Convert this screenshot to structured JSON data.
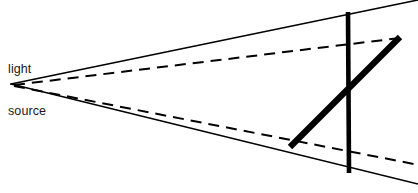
{
  "figure": {
    "background_color": "#ffffff",
    "ink_color": "#000000",
    "width": 418,
    "height": 193
  },
  "labels": {
    "light_source": {
      "line1": "light",
      "line2": "source",
      "x": 8,
      "y": 34,
      "color": "#1a1a1a"
    }
  },
  "geometry": {
    "light_source_point": {
      "x": 11,
      "y": 84
    },
    "solid_rays": [
      {
        "name": "upper-solid-ray",
        "x1": 11,
        "y1": 84,
        "x2": 418,
        "y2": 0,
        "stroke_width": 1.6,
        "style": "solid"
      },
      {
        "name": "lower-solid-ray",
        "x1": 11,
        "y1": 84,
        "x2": 418,
        "y2": 184,
        "stroke_width": 1.6,
        "style": "solid"
      }
    ],
    "dashed_rays": [
      {
        "name": "upper-dashed-ray",
        "x1": 14,
        "y1": 85,
        "x2": 400,
        "y2": 38,
        "stroke_width": 2.0,
        "style": "dashed",
        "dash_pattern": "11 7"
      },
      {
        "name": "lower-dashed-ray",
        "x1": 14,
        "y1": 86,
        "x2": 414,
        "y2": 164,
        "stroke_width": 2.0,
        "style": "dashed",
        "dash_pattern": "11 7"
      }
    ],
    "objects": [
      {
        "name": "vertical-bar",
        "x1": 348,
        "y1": 12,
        "x2": 349,
        "y2": 173,
        "stroke_width": 4.6,
        "style": "solid"
      },
      {
        "name": "diagonal-bar",
        "x1": 290,
        "y1": 147,
        "x2": 400,
        "y2": 37,
        "stroke_width": 6.2,
        "style": "solid"
      }
    ]
  }
}
